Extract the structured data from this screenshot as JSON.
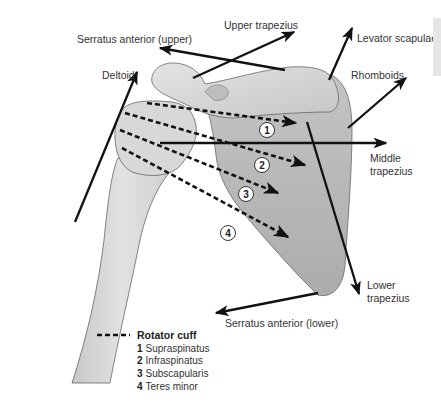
{
  "colors": {
    "bone_light": "#dcdcdc",
    "scapula": "#b8b8b8",
    "outline": "#555555",
    "arrow": "#111111",
    "text": "#333333",
    "side_tab": "#e6e6e6"
  },
  "labels": {
    "serratus_upper": "Serratus anterior (upper)",
    "upper_trapezius": "Upper trapezius",
    "levator_scapulae": "Levator scapulae",
    "deltoid": "Deltoid",
    "rhomboids": "Rhomboids",
    "middle_trapezius_1": "Middle",
    "middle_trapezius_2": "trapezius",
    "lower_trapezius_1": "Lower",
    "lower_trapezius_2": "trapezius",
    "serratus_lower": "Serratus anterior (lower)"
  },
  "markers": [
    "1",
    "2",
    "3",
    "4"
  ],
  "legend": {
    "title": "Rotator cuff",
    "items": [
      {
        "num": "1",
        "name": "Supraspinatus"
      },
      {
        "num": "2",
        "name": "Infraspinatus"
      },
      {
        "num": "3",
        "name": "Subscapularis"
      },
      {
        "num": "4",
        "name": "Teres minor"
      }
    ]
  }
}
